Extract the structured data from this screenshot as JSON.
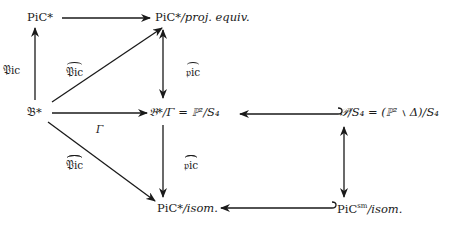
{
  "diagram": {
    "nodes": {
      "pic_star": "PiC*",
      "pic_proj": {
        "main": "PiC*",
        "suffix": "/proj. equiv."
      },
      "b_star": "𝔅*",
      "b_quot": {
        "main": "𝔅*/Γ = ℙ²/S₄"
      },
      "p_quot": {
        "main": "𝒫/S₄ = (ℙ² ∖ Δ)/S₄"
      },
      "pic_isom": {
        "main": "PiC*",
        "suffix": "/isom."
      },
      "pic_sm": {
        "main": "PiC",
        "sup": "sm",
        "suffix": "/isom."
      }
    },
    "edge_labels": {
      "Pic_vertical": "𝔓ic",
      "Pic_hat_diag": "𝔓ic",
      "pic_hat_vertical": "𝔭ic",
      "Gamma": "Γ",
      "Pic_doublehat_diag": "𝔓ic",
      "pic_doublehat_vertical": "𝔭ic"
    }
  }
}
